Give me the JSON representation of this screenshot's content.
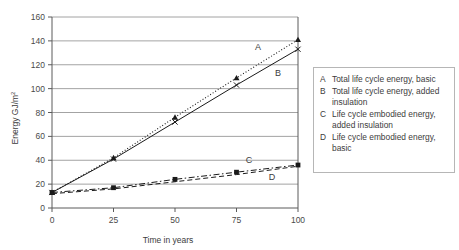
{
  "chart_data": {
    "type": "line",
    "title": "",
    "xlabel": "Time in years",
    "ylabel": "Energy GJ/m2",
    "ylabel_base": "Energy GJ/m",
    "ylabel_sup": "2",
    "x": [
      0,
      25,
      50,
      75,
      100
    ],
    "xlim": [
      0,
      100
    ],
    "ylim": [
      0,
      160
    ],
    "xticks": [
      "0",
      "25",
      "50",
      "75",
      "100"
    ],
    "yticks": [
      "0",
      "20",
      "40",
      "60",
      "80",
      "100",
      "120",
      "140",
      "160"
    ],
    "grid": "horizontal",
    "legend_position": "right-outside",
    "series": [
      {
        "key": "A",
        "name": "Total life cycle energy, basic",
        "values": [
          13,
          42,
          76,
          109,
          141
        ],
        "line_style": "dotted",
        "marker": "triangle",
        "color": "#1a1a1a",
        "inline_label": "A"
      },
      {
        "key": "B",
        "name": "Total life cycle energy, added insulation",
        "values": [
          13,
          41,
          72,
          103,
          133
        ],
        "line_style": "solid",
        "marker": "x",
        "color": "#1a1a1a",
        "inline_label": "B"
      },
      {
        "key": "C",
        "name": "Life cycle embodied energy, added insulation",
        "values": [
          13,
          17,
          24,
          30,
          36
        ],
        "line_style": "dashdot",
        "marker": "square",
        "color": "#1a1a1a",
        "inline_label": "C"
      },
      {
        "key": "D",
        "name": "Life cycle embodied energy, basic",
        "values": [
          12,
          16,
          22,
          28,
          35
        ],
        "line_style": "dashed",
        "marker": "none",
        "color": "#1a1a1a",
        "inline_label": "D"
      }
    ]
  },
  "legend": {
    "entries": [
      {
        "key": "A",
        "text": "Total life cycle energy, basic"
      },
      {
        "key": "B",
        "text": "Total life cycle energy, added insulation"
      },
      {
        "key": "C",
        "text": "Life cycle embodied energy, added insulation"
      },
      {
        "key": "D",
        "text": "Life cycle embodied energy, basic"
      }
    ]
  },
  "axes": {
    "x_title": "Time in years",
    "y_title_base": "Energy GJ/m",
    "y_title_sup": "2"
  },
  "colors": {
    "line": "#1a1a1a",
    "grid": "#8c8c8c",
    "axis": "#5a5a5a",
    "text": "#3c3c3c",
    "legend_border": "#b6b6b6",
    "background": "#ffffff"
  }
}
